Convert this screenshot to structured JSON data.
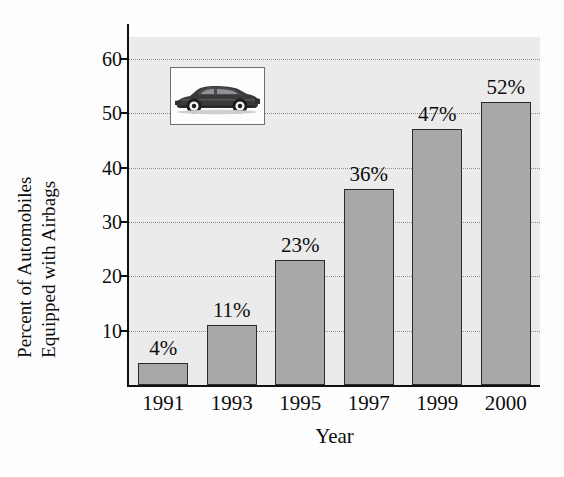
{
  "chart_data": {
    "type": "bar",
    "title": "",
    "subtitle": "",
    "categories": [
      "1991",
      "1993",
      "1995",
      "1997",
      "1999",
      "2000"
    ],
    "values": [
      4,
      11,
      23,
      36,
      47,
      52
    ],
    "data_labels": [
      "4%",
      "11%",
      "23%",
      "36%",
      "47%",
      "52%"
    ],
    "xlabel": "Year",
    "ylabel_line1": "Percent of Automobiles",
    "ylabel_line2": "Equipped with Airbags",
    "ylim": [
      0,
      64
    ],
    "yticks": [
      10,
      20,
      30,
      40,
      50,
      60
    ],
    "ytick_labels": [
      "10",
      "20",
      "30",
      "40",
      "50",
      "60"
    ],
    "grid": true,
    "grid_style": "dotted-horizontal",
    "legend": "none",
    "annotations": [
      {
        "name": "car-photo-inset",
        "description": "sedan automobile photograph in white framed box"
      }
    ],
    "colors": {
      "bar_fill": "#a8a8a8",
      "bar_edge": "#2b2b2b",
      "plot_background": "#ebebeb",
      "figure_background": "#fdfdfd",
      "gridline": "#8e8e8e",
      "axis": "#111111",
      "text": "#0d0d0d",
      "car_body": "#3a3a3a"
    }
  }
}
